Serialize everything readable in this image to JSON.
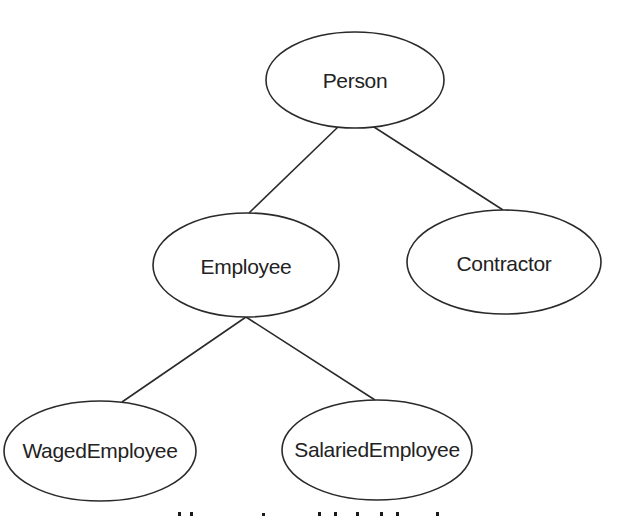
{
  "diagram": {
    "type": "class-hierarchy-tree",
    "colors": {
      "stroke": "#2a2a2a",
      "text": "#222222",
      "background": "#ffffff"
    },
    "nodes": [
      {
        "id": "person",
        "label": "Person",
        "cx": 355,
        "cy": 80,
        "rx": 89,
        "ry": 48
      },
      {
        "id": "employee",
        "label": "Employee",
        "cx": 246,
        "cy": 265,
        "rx": 93,
        "ry": 52
      },
      {
        "id": "contractor",
        "label": "Contractor",
        "cx": 504,
        "cy": 262,
        "rx": 97,
        "ry": 52
      },
      {
        "id": "waged-employee",
        "label": "WagedEmployee",
        "cx": 100,
        "cy": 451,
        "rx": 96,
        "ry": 50
      },
      {
        "id": "salaried-employee",
        "label": "SalariedEmployee",
        "cx": 377,
        "cy": 450,
        "rx": 95,
        "ry": 50
      }
    ],
    "edges": [
      {
        "from": "person",
        "to": "employee"
      },
      {
        "from": "person",
        "to": "contractor"
      },
      {
        "from": "employee",
        "to": "waged-employee"
      },
      {
        "from": "employee",
        "to": "salaried-employee"
      }
    ],
    "caption": {
      "visible_text": "",
      "note": "caption cut off at bottom edge; only ascender tops visible"
    }
  }
}
